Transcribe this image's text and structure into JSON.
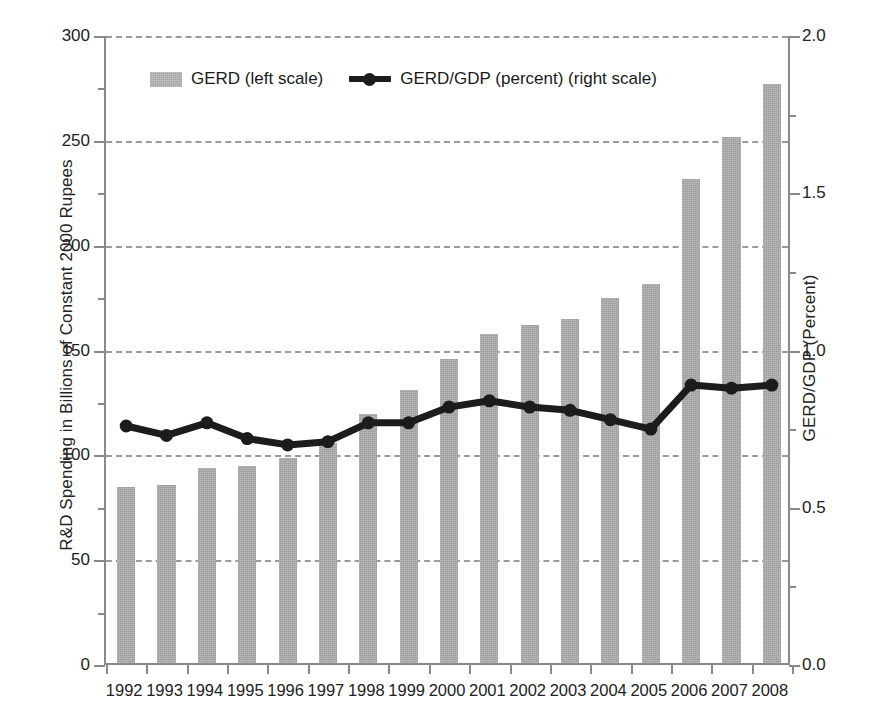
{
  "chart_data": {
    "type": "bar",
    "title": "",
    "subtitle": "",
    "xlabel": "",
    "ylabel": "R&D Spending in Billions of Constant 2000 Rupees",
    "y2label": "GERD/GDP (Percent)",
    "categories": [
      "1992",
      "1993",
      "1994",
      "1995",
      "1996",
      "1997",
      "1998",
      "1999",
      "2000",
      "2001",
      "2002",
      "2003",
      "2004",
      "2005",
      "2006",
      "2007",
      "2008"
    ],
    "ylim": [
      0,
      300
    ],
    "y2lim": [
      0.0,
      2.0
    ],
    "yticks": [
      "0",
      "50",
      "100",
      "150",
      "200",
      "250",
      "300"
    ],
    "ytick_values": [
      0,
      50,
      100,
      150,
      200,
      250,
      300
    ],
    "y2ticks": [
      "0.0",
      "0.5",
      "1.0",
      "1.5",
      "2.0"
    ],
    "y2tick_values": [
      0.0,
      0.5,
      1.0,
      1.5,
      2.0
    ],
    "grid": true,
    "grid_style": "dashed-horizontal",
    "legend_position": "top-center-inside",
    "series": [
      {
        "name": "GERD (left scale)",
        "type": "bar",
        "axis": "left",
        "color": "#9d9d9d",
        "values": [
          84,
          85,
          93,
          94,
          98,
          105,
          119,
          130,
          145,
          157,
          161,
          164,
          174,
          181,
          231,
          251,
          276
        ]
      },
      {
        "name": "GERD/GDP (percent) (right scale)",
        "type": "line",
        "axis": "right",
        "color": "#1c1c1c",
        "marker": "circle",
        "values": [
          0.76,
          0.73,
          0.77,
          0.72,
          0.7,
          0.71,
          0.77,
          0.77,
          0.82,
          0.84,
          0.82,
          0.81,
          0.78,
          0.75,
          0.89,
          0.88,
          0.89
        ]
      }
    ]
  },
  "legend": {
    "bar_label": "GERD (left scale)",
    "line_label": "GERD/GDP (percent) (right scale)"
  },
  "axes": {
    "left_title": "R&D Spending in Billions of Constant 2000 Rupees",
    "right_title": "GERD/GDP (Percent)"
  },
  "colors": {
    "bar": "#9d9d9d",
    "line": "#1c1c1c",
    "grid": "#9b9b9b",
    "axis": "#8a8a8a",
    "text": "#1a1a1a",
    "background": "#ffffff"
  }
}
